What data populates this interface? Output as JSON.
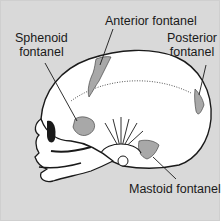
{
  "diagram": {
    "labels": {
      "sphenoid": [
        "Sphenoid",
        "fontanel"
      ],
      "anterior": "Anterior fontanel",
      "posterior": [
        "Posterior",
        "fontanel"
      ],
      "mastoid": "Mastoid fontanel"
    },
    "colors": {
      "background": "#d9d9d9",
      "bone": "#ffffff",
      "fontanel": "#a8a8a8",
      "ink": "#1a1a1a"
    }
  }
}
